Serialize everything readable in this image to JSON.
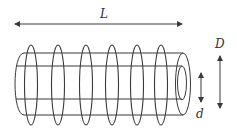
{
  "diagram": {
    "labels": {
      "length": "L",
      "outer_diameter": "D",
      "inner_diameter": "d"
    },
    "coil_count": 6,
    "colors": {
      "stroke": "#3a3a3a",
      "background": "#ffffff"
    }
  }
}
